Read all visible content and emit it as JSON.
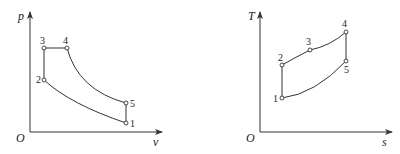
{
  "diagrams": {
    "pv": {
      "y_axis_label": "p",
      "x_axis_label": "v",
      "origin_label": "O",
      "points": [
        {
          "id": "1",
          "label": "1"
        },
        {
          "id": "2",
          "label": "2"
        },
        {
          "id": "3",
          "label": "3"
        },
        {
          "id": "4",
          "label": "4"
        },
        {
          "id": "5",
          "label": "5"
        }
      ]
    },
    "ts": {
      "y_axis_label": "T",
      "x_axis_label": "s",
      "origin_label": "O",
      "points": [
        {
          "id": "1",
          "label": "1"
        },
        {
          "id": "2",
          "label": "2"
        },
        {
          "id": "3",
          "label": "3"
        },
        {
          "id": "4",
          "label": "4"
        },
        {
          "id": "5",
          "label": "5"
        }
      ]
    }
  },
  "colors": {
    "line": "#333333",
    "background": "#ffffff"
  }
}
